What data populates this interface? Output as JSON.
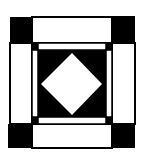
{
  "figure": {
    "colors": {
      "ink": "#000000",
      "paper": "#ffffff"
    },
    "parts": [
      "corner-squares",
      "border-strips",
      "inner-frame",
      "center-square",
      "center-diamond"
    ]
  }
}
